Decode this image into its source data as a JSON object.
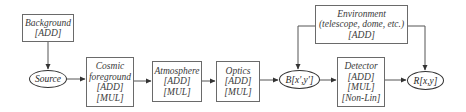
{
  "diagram": {
    "nodes": {
      "background": {
        "label": "Background",
        "tags": [
          "[ADD]"
        ]
      },
      "source": {
        "label": "Source"
      },
      "cosmic": {
        "label1": "Cosmic",
        "label2": "foreground",
        "tags": [
          "[ADD]",
          "[MUL]"
        ]
      },
      "atmosphere": {
        "label": "Atmosphere",
        "tags": [
          "[ADD]",
          "[MUL]"
        ]
      },
      "optics": {
        "label": "Optics",
        "tags": [
          "[ADD]",
          "[MUL]"
        ]
      },
      "b": {
        "label": "B[x',y']"
      },
      "environment": {
        "label": "Environment",
        "sublabel": "(telescope, dome, etc.)",
        "tags": [
          "[ADD]"
        ]
      },
      "detector": {
        "label": "Detector",
        "tags": [
          "[ADD]",
          "[MUL]",
          "[Non-Lin]"
        ]
      },
      "r": {
        "label": "R[x,y]"
      }
    },
    "edges": [
      {
        "from": "Background",
        "to": "Source"
      },
      {
        "from": "Source",
        "to": "Cosmic foreground"
      },
      {
        "from": "Cosmic foreground",
        "to": "Atmosphere"
      },
      {
        "from": "Atmosphere",
        "to": "Optics"
      },
      {
        "from": "Optics",
        "to": "B[x',y']"
      },
      {
        "from": "Environment",
        "to": "B[x',y']"
      },
      {
        "from": "B[x',y']",
        "to": "Detector"
      },
      {
        "from": "Detector",
        "to": "R[x,y]"
      },
      {
        "from": "Environment",
        "to": "R[x,y]"
      }
    ],
    "colors": {
      "box_border": "#6a6a6a",
      "ellipse_border": "#333333",
      "line": "#555555",
      "text": "#3a3a3a"
    }
  }
}
